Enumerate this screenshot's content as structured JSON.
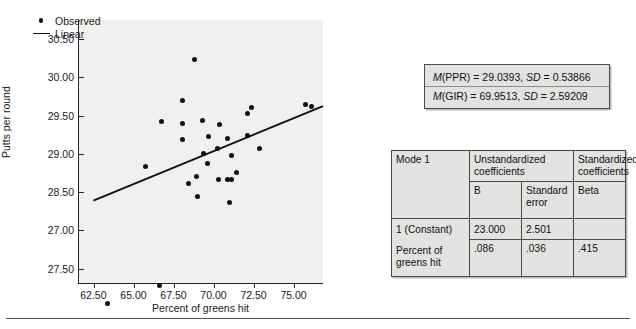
{
  "chart_data": {
    "type": "scatter",
    "title": "",
    "xlabel": "Percent of greens hit",
    "ylabel": "Putts per round",
    "xlim": [
      61.6,
      76.9
    ],
    "ylim_top": 30.75,
    "ylim_bottom": 27.3,
    "xticks": [
      "62.50",
      "65.00",
      "67.50",
      "70.00",
      "72.50",
      "75.00"
    ],
    "xtick_values": [
      62.5,
      65.0,
      67.5,
      70.0,
      72.5,
      75.0
    ],
    "yticks": [
      "30.50",
      "30.00",
      "29.50",
      "29.00",
      "28.50",
      "27.00",
      "27.50"
    ],
    "ytick_values": [
      30.5,
      30.0,
      29.5,
      29.0,
      28.5,
      28.0,
      27.5
    ],
    "grid": false,
    "legend_position": "top-left",
    "legend": [
      {
        "name": "Observed",
        "marker": "dot"
      },
      {
        "name": "Linear",
        "marker": "line"
      }
    ],
    "series": [
      {
        "name": "Observed",
        "marker": "dot",
        "points": [
          [
            63.4,
            27.04
          ],
          [
            66.6,
            27.28
          ],
          [
            65.75,
            28.84
          ],
          [
            66.75,
            29.42
          ],
          [
            68.05,
            29.7
          ],
          [
            68.05,
            29.4
          ],
          [
            68.05,
            29.19
          ],
          [
            68.8,
            30.24
          ],
          [
            68.45,
            28.61
          ],
          [
            68.95,
            28.7
          ],
          [
            69.0,
            28.45
          ],
          [
            69.3,
            29.44
          ],
          [
            69.35,
            29.01
          ],
          [
            69.7,
            29.23
          ],
          [
            69.65,
            28.88
          ],
          [
            70.25,
            29.07
          ],
          [
            70.35,
            29.38
          ],
          [
            70.3,
            28.66
          ],
          [
            70.85,
            29.2
          ],
          [
            70.9,
            28.66
          ],
          [
            71.15,
            28.66
          ],
          [
            71.1,
            28.98
          ],
          [
            71.0,
            28.37
          ],
          [
            71.45,
            28.76
          ],
          [
            72.15,
            29.53
          ],
          [
            72.15,
            29.24
          ],
          [
            72.4,
            29.61
          ],
          [
            72.85,
            29.07
          ],
          [
            75.75,
            29.65
          ],
          [
            76.15,
            29.62
          ]
        ]
      }
    ],
    "trend_line": {
      "name": "Linear",
      "x_start": 62.5,
      "y_start": 28.38,
      "x_end": 76.9,
      "y_end": 29.62
    }
  },
  "stats_box": {
    "lines": [
      {
        "stat": "M",
        "var": "(PPR) = 29.0393, ",
        "sd_label": "SD",
        "sd_value": " = 0.53866"
      },
      {
        "stat": "M",
        "var": "(GIR) = 69.9513, ",
        "sd_label": "SD",
        "sd_value": " = 2.59209"
      }
    ]
  },
  "coef_table": {
    "model_label": "Mode 1",
    "group_headers": {
      "unstandardized": "Unstandardized coefficients",
      "standardized": "Standardized coefficients"
    },
    "column_headers": {
      "b": "B",
      "std_error": "Standard error",
      "beta": "Beta"
    },
    "rows": [
      {
        "label": "1 (Constant)",
        "b": "23.000",
        "std_error": "2.501",
        "beta": ""
      },
      {
        "label": "Percent of greens hit",
        "b": ".086",
        "std_error": ".036",
        "beta": ".415"
      }
    ]
  }
}
